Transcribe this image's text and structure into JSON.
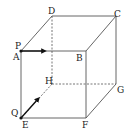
{
  "diagram": {
    "type": "cube",
    "vertices": {
      "A": {
        "label": "A",
        "x": 21,
        "y": 51
      },
      "B": {
        "label": "B",
        "x": 86,
        "y": 51
      },
      "C": {
        "label": "C",
        "x": 116,
        "y": 16
      },
      "D": {
        "label": "D",
        "x": 52,
        "y": 16
      },
      "E": {
        "label": "E",
        "x": 21,
        "y": 118
      },
      "F": {
        "label": "F",
        "x": 86,
        "y": 118
      },
      "G": {
        "label": "G",
        "x": 116,
        "y": 84
      },
      "H": {
        "label": "H",
        "x": 52,
        "y": 84
      }
    },
    "points": {
      "P": {
        "label": "P",
        "at": "A",
        "direction": "A→B"
      },
      "Q": {
        "label": "Q",
        "at": "E",
        "direction": "E→H"
      }
    },
    "hidden_edges": [
      "D-H",
      "H-E",
      "H-G"
    ],
    "visible_edges": [
      "A-B",
      "B-C",
      "C-D",
      "D-A",
      "A-E",
      "B-F",
      "C-G",
      "E-F",
      "F-G"
    ]
  }
}
